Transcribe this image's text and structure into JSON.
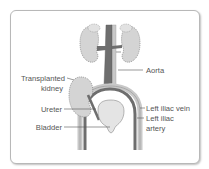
{
  "figure": {
    "labels": {
      "transplanted_kidney_line1": "Transplanted",
      "transplanted_kidney_line2": "kidney",
      "ureter": "Ureter",
      "bladder": "Bladder",
      "aorta": "Aorta",
      "left_iliac_vein": "Left iliac vein",
      "left_iliac_artery_line1": "Left iliac",
      "left_iliac_artery_line2": "artery"
    },
    "colors": {
      "kidney_fill": "#d4d4d4",
      "kidney_outline": "#8a8a8a",
      "artery": "#6e6e6e",
      "vein": "#c8c8c8",
      "bladder_fill": "#e4e4e4",
      "leader_line": "#555555",
      "frame_border": "#b8b8b8"
    }
  }
}
